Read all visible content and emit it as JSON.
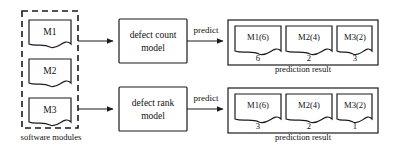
{
  "figure": {
    "type": "flow-diagram",
    "background": "#ffffff",
    "line_color": "#1b1b1b"
  },
  "software_modules": {
    "caption": "software modules",
    "items": [
      {
        "label": "M1"
      },
      {
        "label": "M2"
      },
      {
        "label": "M3"
      }
    ]
  },
  "models": [
    {
      "line1": "defect count",
      "line2": "model"
    },
    {
      "line1": "defect rank",
      "line2": "model"
    }
  ],
  "arrows": {
    "predict_label": "predict"
  },
  "results": [
    {
      "caption": "prediction result",
      "items": [
        {
          "label": "M1(6)",
          "value": "6"
        },
        {
          "label": "M2(4)",
          "value": "2"
        },
        {
          "label": "M3(2)",
          "value": "3"
        }
      ]
    },
    {
      "caption": "prediction result",
      "items": [
        {
          "label": "M1(6)",
          "value": "3"
        },
        {
          "label": "M2(4)",
          "value": "2"
        },
        {
          "label": "M3(2)",
          "value": "1"
        }
      ]
    }
  ]
}
